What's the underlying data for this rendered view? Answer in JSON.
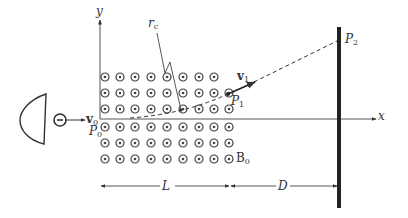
{
  "diagram": {
    "labels": {
      "y_axis": "y",
      "x_axis": "x",
      "rc": "r",
      "rc_sub": "c",
      "v0": "v",
      "v0_sub": "0",
      "v1": "v",
      "v1_sub": "1",
      "p0": "P",
      "p0_sub": "0",
      "p1": "P",
      "p1_sub": "1",
      "p2": "P",
      "p2_sub": "2",
      "b0": "B",
      "b0_sub": "0",
      "L": "L",
      "D": "D"
    },
    "field": {
      "symbol": "dot-in-circle (out of page)",
      "columns": 9,
      "rows_above_axis": 3,
      "rows_below_axis": 3
    },
    "colors": {
      "ink": "#333333",
      "screen": "#222222",
      "background": "#ffffff"
    }
  }
}
